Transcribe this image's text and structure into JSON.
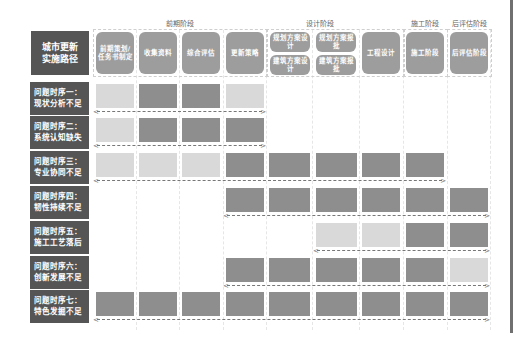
{
  "title": "城市更新实施路径",
  "phases": [
    {
      "label": "前期阶段"
    },
    {
      "label": "设计阶段"
    },
    {
      "label": "施工阶段"
    },
    {
      "label": "后评估阶段"
    }
  ],
  "stages": [
    {
      "label": "前期策划/任务书制定"
    },
    {
      "label": "收集资料"
    },
    {
      "label": "综合评估"
    },
    {
      "label": "更新策略"
    },
    {
      "label": "规划方案设计"
    },
    {
      "label": "建筑方案设计"
    },
    {
      "label": "规划方案报批"
    },
    {
      "label": "建筑方案报批"
    },
    {
      "label": "工程设计"
    },
    {
      "label": "施工阶段"
    },
    {
      "label": "后评估阶段"
    }
  ],
  "rows": [
    {
      "label": "问题时序一：现状分析不足",
      "cells": [
        "L",
        "D",
        "D",
        "L",
        "",
        "",
        "",
        "",
        ""
      ],
      "arrow": [
        1,
        4
      ]
    },
    {
      "label": "问题时序二：系统认知缺失",
      "cells": [
        "L",
        "D",
        "D",
        "D",
        "",
        "",
        "",
        "",
        ""
      ],
      "arrow": [
        1,
        4
      ]
    },
    {
      "label": "问题时序三：专业协同不足",
      "cells": [
        "L",
        "L",
        "L",
        "D",
        "D",
        "D",
        "D",
        "D",
        ""
      ],
      "arrow": [
        1,
        8
      ]
    },
    {
      "label": "问题时序四：韧性持续不足",
      "cells": [
        "",
        "",
        "",
        "D",
        "D",
        "D",
        "D",
        "D",
        "D"
      ],
      "arrow": [
        4,
        9
      ]
    },
    {
      "label": "问题时序五：施工工艺落后",
      "cells": [
        "",
        "",
        "",
        "",
        "",
        "L",
        "L",
        "D",
        "D"
      ],
      "arrow": [
        6,
        9
      ]
    },
    {
      "label": "问题时序六：创新发展不足",
      "cells": [
        "",
        "",
        "",
        "D",
        "D",
        "D",
        "D",
        "D",
        "L"
      ],
      "arrow": [
        4,
        9
      ]
    },
    {
      "label": "问题时序七：特色发掘不足",
      "cells": [
        "D",
        "D",
        "D",
        "D",
        "D",
        "D",
        "D",
        "D",
        "D"
      ],
      "arrow": [
        1,
        9
      ]
    }
  ],
  "legend": {
    "light": "#d9d9d9",
    "dark": "#8e8e8e"
  }
}
